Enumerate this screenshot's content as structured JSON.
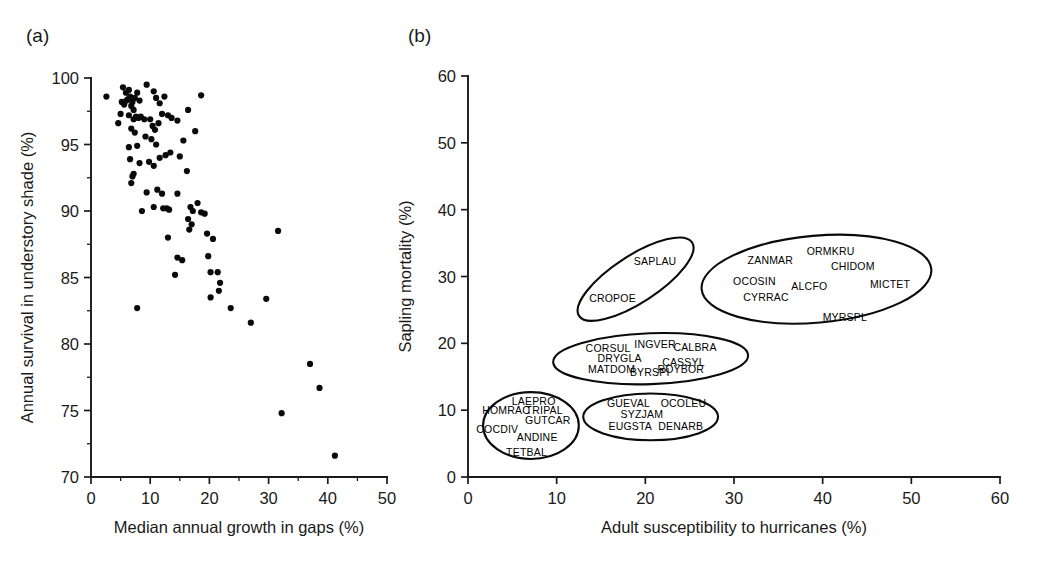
{
  "figure": {
    "panel_a_tag": "(a)",
    "panel_b_tag": "(b)",
    "ink_color": "#1a1a1a",
    "point_color": "#0a0a0a"
  },
  "chart_data": [
    {
      "type": "scatter",
      "panel": "(a)",
      "title": "",
      "xlabel": "Median annual growth in gaps (%)",
      "ylabel": "Annual survival in understory shade (%)",
      "xlim": [
        0,
        50
      ],
      "ylim": [
        70,
        100
      ],
      "xticks": [
        0,
        10,
        20,
        30,
        40,
        50
      ],
      "yticks": [
        70,
        75,
        80,
        85,
        90,
        95,
        100
      ],
      "xtick_labels": [
        "0",
        "10",
        "20",
        "30",
        "40",
        "50"
      ],
      "ytick_labels": [
        "70",
        "75",
        "80",
        "85",
        "90",
        "95",
        "100"
      ],
      "minor_tick_step_x": 5,
      "minor_tick_step_y": 2.5,
      "grid": false,
      "legend": "none",
      "marker": "filled-circle",
      "points": [
        [
          2.6,
          98.6
        ],
        [
          5.4,
          99.3
        ],
        [
          5.9,
          98.9
        ],
        [
          6.4,
          99.1
        ],
        [
          6.2,
          98.4
        ],
        [
          5.2,
          98.2
        ],
        [
          5.6,
          98.0
        ],
        [
          6.0,
          98.3
        ],
        [
          6.6,
          98.6
        ],
        [
          7.0,
          98.2
        ],
        [
          6.8,
          97.9
        ],
        [
          7.4,
          98.5
        ],
        [
          7.8,
          98.9
        ],
        [
          8.2,
          98.3
        ],
        [
          7.2,
          97.6
        ],
        [
          9.4,
          99.5
        ],
        [
          10.6,
          99.0
        ],
        [
          11.0,
          98.5
        ],
        [
          11.6,
          98.1
        ],
        [
          12.4,
          98.6
        ],
        [
          5.0,
          97.3
        ],
        [
          4.6,
          96.6
        ],
        [
          6.4,
          97.2
        ],
        [
          7.2,
          96.9
        ],
        [
          7.6,
          97.1
        ],
        [
          8.0,
          97.0
        ],
        [
          8.4,
          97.1
        ],
        [
          9.0,
          96.9
        ],
        [
          6.8,
          96.2
        ],
        [
          7.4,
          95.9
        ],
        [
          10.0,
          96.9
        ],
        [
          10.4,
          96.4
        ],
        [
          10.8,
          96.1
        ],
        [
          11.4,
          96.6
        ],
        [
          12.0,
          97.3
        ],
        [
          13.0,
          97.2
        ],
        [
          13.6,
          97.0
        ],
        [
          14.6,
          96.8
        ],
        [
          16.4,
          97.6
        ],
        [
          18.6,
          98.7
        ],
        [
          17.6,
          96.0
        ],
        [
          15.6,
          95.3
        ],
        [
          6.4,
          94.8
        ],
        [
          7.8,
          94.9
        ],
        [
          9.2,
          95.6
        ],
        [
          10.2,
          95.4
        ],
        [
          11.0,
          95.0
        ],
        [
          6.6,
          93.9
        ],
        [
          8.2,
          93.6
        ],
        [
          9.8,
          93.7
        ],
        [
          10.6,
          93.4
        ],
        [
          11.6,
          94.0
        ],
        [
          12.6,
          94.2
        ],
        [
          13.4,
          94.4
        ],
        [
          15.0,
          94.1
        ],
        [
          16.2,
          93.0
        ],
        [
          7.2,
          92.8
        ],
        [
          7.0,
          92.6
        ],
        [
          6.8,
          92.1
        ],
        [
          9.4,
          91.4
        ],
        [
          11.2,
          91.6
        ],
        [
          12.0,
          91.3
        ],
        [
          14.6,
          91.3
        ],
        [
          8.6,
          90.0
        ],
        [
          10.6,
          90.3
        ],
        [
          12.2,
          90.2
        ],
        [
          12.8,
          90.2
        ],
        [
          13.2,
          90.1
        ],
        [
          16.8,
          90.3
        ],
        [
          17.2,
          90.0
        ],
        [
          18.0,
          90.6
        ],
        [
          18.6,
          89.9
        ],
        [
          19.2,
          89.8
        ],
        [
          16.4,
          89.4
        ],
        [
          17.0,
          89.0
        ],
        [
          16.6,
          88.6
        ],
        [
          13.0,
          88.0
        ],
        [
          19.6,
          88.3
        ],
        [
          20.6,
          87.9
        ],
        [
          31.6,
          88.5
        ],
        [
          14.6,
          86.5
        ],
        [
          15.4,
          86.3
        ],
        [
          19.8,
          86.6
        ],
        [
          20.2,
          85.4
        ],
        [
          14.2,
          85.2
        ],
        [
          21.4,
          85.4
        ],
        [
          21.8,
          84.6
        ],
        [
          21.6,
          84.0
        ],
        [
          20.2,
          83.5
        ],
        [
          29.6,
          83.4
        ],
        [
          23.6,
          82.7
        ],
        [
          7.8,
          82.7
        ],
        [
          27.0,
          81.6
        ],
        [
          37.0,
          78.5
        ],
        [
          38.6,
          76.7
        ],
        [
          32.2,
          74.8
        ],
        [
          41.2,
          71.6
        ]
      ]
    },
    {
      "type": "scatter",
      "panel": "(b)",
      "title": "",
      "xlabel": "Adult susceptibility to hurricanes (%)",
      "ylabel": "Sapling mortality (%)",
      "xlim": [
        0,
        60
      ],
      "ylim": [
        0,
        60
      ],
      "xticks": [
        0,
        10,
        20,
        30,
        40,
        50,
        60
      ],
      "yticks": [
        0,
        10,
        20,
        30,
        40,
        50,
        60
      ],
      "xtick_labels": [
        "0",
        "10",
        "20",
        "30",
        "40",
        "50",
        "60"
      ],
      "ytick_labels": [
        "0",
        "10",
        "20",
        "30",
        "40",
        "50",
        "60"
      ],
      "minor_tick_step_x": 5,
      "minor_tick_step_y": 5,
      "grid": false,
      "legend": "none",
      "marker": "species-code-text",
      "groups": [
        {
          "group_id": "group-saplau-cropoe",
          "ellipse": {
            "cx": 18.9,
            "cy": 29.6,
            "rx": 7.6,
            "ry": 3.5,
            "rotation_deg": -33
          },
          "species": [
            {
              "code": "SAPLAU",
              "x": 21.1,
              "y": 32.3
            },
            {
              "code": "CROPOE",
              "x": 16.3,
              "y": 26.8
            }
          ]
        },
        {
          "group_id": "group-hurricane-tolerant",
          "ellipse": {
            "cx": 39.3,
            "cy": 29.6,
            "rx": 13.0,
            "ry": 6.5,
            "rotation_deg": -5
          },
          "species": [
            {
              "code": "ORMKRU",
              "x": 40.9,
              "y": 33.8
            },
            {
              "code": "ZANMAR",
              "x": 34.1,
              "y": 32.4
            },
            {
              "code": "CHIDOM",
              "x": 43.4,
              "y": 31.5
            },
            {
              "code": "OCOSIN",
              "x": 32.3,
              "y": 29.3
            },
            {
              "code": "ALCFO",
              "x": 38.5,
              "y": 28.6
            },
            {
              "code": "MICTET",
              "x": 47.6,
              "y": 28.9
            },
            {
              "code": "CYRRAC",
              "x": 33.6,
              "y": 26.9
            },
            {
              "code": "MYRSPL",
              "x": 42.5,
              "y": 23.9
            }
          ]
        },
        {
          "group_id": "group-intermediate",
          "ellipse": {
            "cx": 20.6,
            "cy": 17.7,
            "rx": 11.0,
            "ry": 3.8,
            "rotation_deg": -2
          },
          "species": [
            {
              "code": "INGVER",
              "x": 21.1,
              "y": 19.9
            },
            {
              "code": "CORSUL",
              "x": 15.8,
              "y": 19.3
            },
            {
              "code": "CALBRA",
              "x": 25.6,
              "y": 19.5
            },
            {
              "code": "DRYGLA",
              "x": 17.1,
              "y": 17.8
            },
            {
              "code": "CASSYL",
              "x": 24.3,
              "y": 17.2
            },
            {
              "code": "MATDOM",
              "x": 16.2,
              "y": 16.2
            },
            {
              "code": "BYRSPI",
              "x": 20.5,
              "y": 15.7
            },
            {
              "code": "ROYBOR",
              "x": 24.0,
              "y": 16.2
            }
          ]
        },
        {
          "group_id": "group-shade-tolerant-left",
          "ellipse": {
            "cx": 7.1,
            "cy": 7.7,
            "rx": 5.4,
            "ry": 5.0,
            "rotation_deg": 0
          },
          "species": [
            {
              "code": "LAEPRO",
              "x": 7.4,
              "y": 11.3
            },
            {
              "code": "HOMRAC",
              "x": 4.3,
              "y": 10.1
            },
            {
              "code": "TRIPAL",
              "x": 8.6,
              "y": 10.1
            },
            {
              "code": "GUTCAR",
              "x": 9.0,
              "y": 8.6
            },
            {
              "code": "COCDIV",
              "x": 3.3,
              "y": 7.2
            },
            {
              "code": "ANDINE",
              "x": 7.8,
              "y": 6.0
            },
            {
              "code": "TETBAL",
              "x": 6.6,
              "y": 3.7
            }
          ]
        },
        {
          "group_id": "group-shade-tolerant-mid",
          "ellipse": {
            "cx": 20.6,
            "cy": 9.0,
            "rx": 7.6,
            "ry": 3.5,
            "rotation_deg": 0
          },
          "species": [
            {
              "code": "GUEVAL",
              "x": 18.1,
              "y": 11.0
            },
            {
              "code": "OCOLEU",
              "x": 24.3,
              "y": 11.1
            },
            {
              "code": "SYZJAM",
              "x": 19.6,
              "y": 9.4
            },
            {
              "code": "EUGSTA",
              "x": 18.3,
              "y": 7.7
            },
            {
              "code": "DENARB",
              "x": 24.0,
              "y": 7.6
            }
          ]
        }
      ]
    }
  ]
}
